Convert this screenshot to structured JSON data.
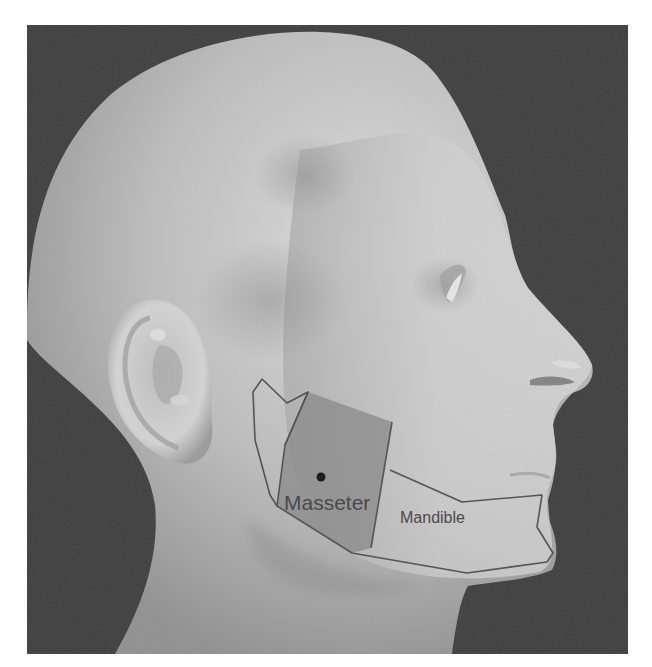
{
  "figure": {
    "colors": {
      "page_background": "#ffffff",
      "photo_background": "#3b3b3b",
      "skin_light": "#d6d6d6",
      "skin_mid": "#b9b9b9",
      "skin_shadow": "#8c8c8c",
      "outline": "#555555",
      "masseter_fill": "#8a8a8a",
      "marker_dot": "#1e1e1e",
      "label_text": "#4a4a4a"
    },
    "regions": [
      {
        "id": "mandible",
        "label": "Mandible",
        "label_position": [
          400,
          523
        ],
        "label_font_size": 16,
        "polygon": [
          [
            253,
            392
          ],
          [
            262,
            379
          ],
          [
            287,
            403
          ],
          [
            308,
            392
          ],
          [
            285,
            445
          ],
          [
            277,
            506
          ],
          [
            352,
            553
          ],
          [
            467,
            573
          ],
          [
            547,
            562
          ],
          [
            553,
            553
          ],
          [
            537,
            527
          ],
          [
            542,
            495
          ],
          [
            462,
            502
          ],
          [
            390,
            470
          ]
        ]
      },
      {
        "id": "masseter",
        "label": "Masseter",
        "label_position": [
          284,
          510
        ],
        "label_font_size": 21,
        "polygon": [
          [
            308,
            392
          ],
          [
            392,
            422
          ],
          [
            371,
            548
          ],
          [
            352,
            553
          ],
          [
            277,
            506
          ],
          [
            285,
            445
          ]
        ]
      }
    ],
    "marker": {
      "name": "masseter-point",
      "cx": 321,
      "cy": 477,
      "r": 4.5
    }
  }
}
